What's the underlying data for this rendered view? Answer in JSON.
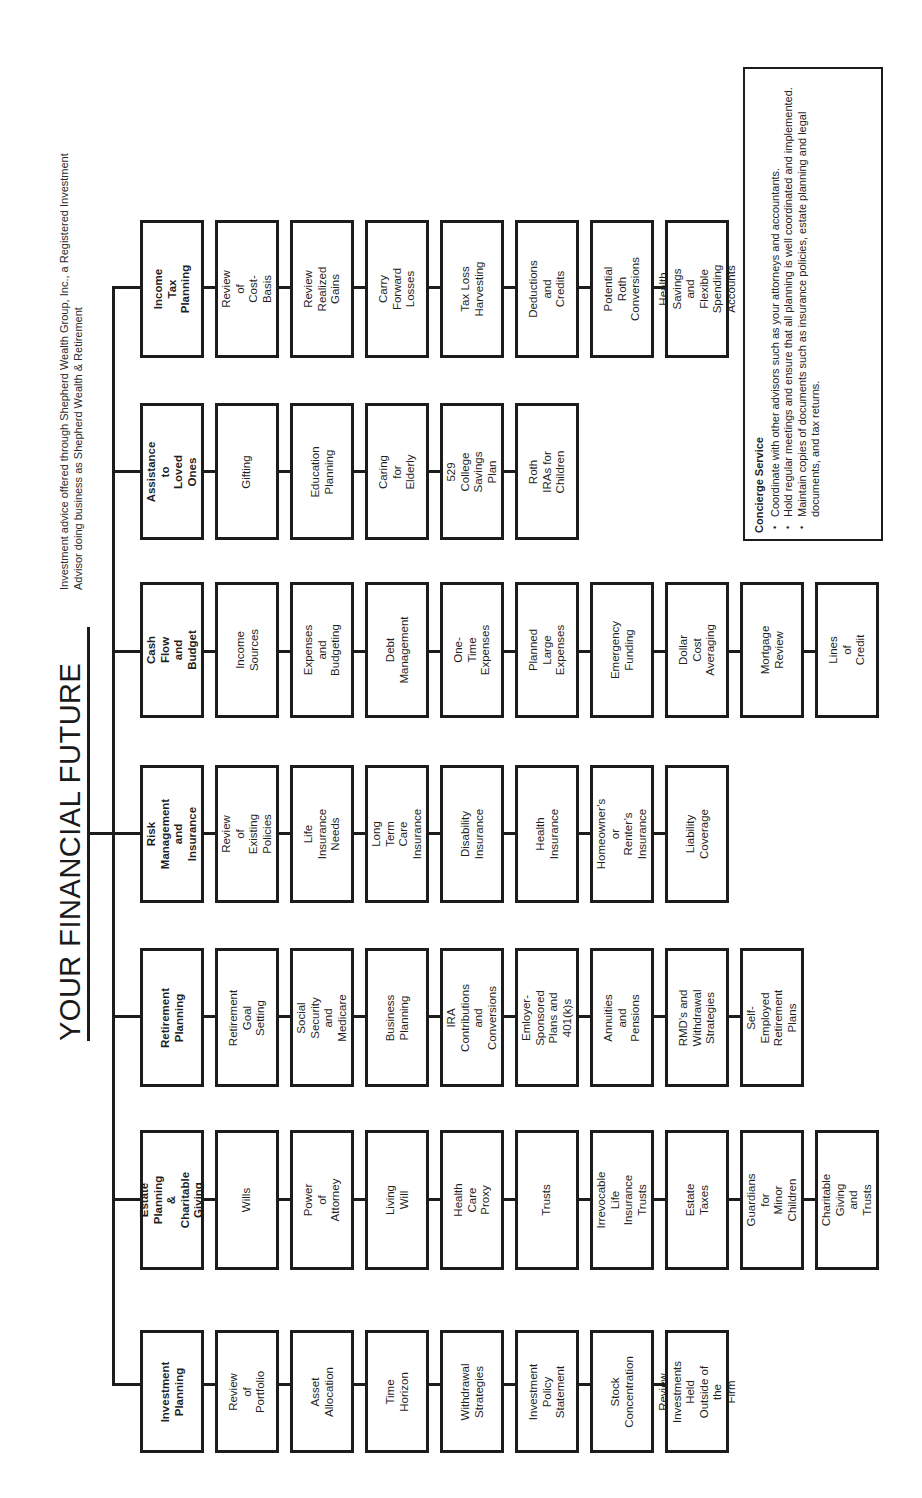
{
  "title": "YOUR FINANCIAL FUTURE",
  "disclaimer": "Investment advice offered through Shepherd Wealth Group, Inc., a Registered Investment\nAdvisor doing business as Shepherd Wealth & Retirement",
  "concierge": {
    "title": "Concierge Service",
    "items": [
      "Coordinate with other advisors such as your attorneys and accountants.",
      "Hold regular meetings and ensure that all planning is well coordinated and implemented.",
      "Maintain copies of documents such as insurance policies, estate planning and legal documents, and tax returns."
    ]
  },
  "groups": [
    {
      "head": "Income Tax\nPlanning",
      "items": [
        "Review of\nCost-Basis",
        "Review Realized\nGains",
        "Carry Forward\nLosses",
        "Tax Loss\nHarvesting",
        "Deductions and\nCredits",
        "Potential Roth\nConversions",
        "Health Savings and\nFlexible Spending\nAccounts"
      ]
    },
    {
      "head": "Assistance to\nLoved Ones",
      "items": [
        "Gifting",
        "Education\nPlanning",
        "Caring for\nElderly",
        "529 College\nSavings Plan",
        "Roth IRAs for\nChildren"
      ]
    },
    {
      "head": "Cash Flow\nand Budget",
      "items": [
        "Income\nSources",
        "Expenses and\nBudgeting",
        "Debt\nManagement",
        "One-Time\nExpenses",
        "Planned Large\nExpenses",
        "Emergency\nFunding",
        "Dollar Cost\nAveraging",
        "Mortgage\nReview",
        "Lines of\nCredit"
      ]
    },
    {
      "head": "Risk Management\nand Insurance",
      "items": [
        "Review of\nExisting Policies",
        "Life Insurance\nNeeds",
        "Long Term Care\nInsurance",
        "Disability\nInsurance",
        "Health\nInsurance",
        "Homeowner’s or\nRenter’s Insurance",
        "Liability\nCoverage"
      ]
    },
    {
      "head": "Retirement\nPlanning",
      "items": [
        "Retirement\nGoal Setting",
        "Social Security\nand Medicare",
        "Business\nPlanning",
        "IRA Contributions\nand Conversions",
        "Emloyer-Sponsored\nPlans and 401(k)s",
        "Annuities and\nPensions",
        "RMD’s and\nWithdrawal Strategies",
        "Self-Employed\nRetirement Plans"
      ]
    },
    {
      "head": "Estate Planning\n& Charitable Giving",
      "items": [
        "Wills",
        "Power of\nAttorney",
        "Living Will",
        "Health Care\nProxy",
        "Trusts",
        "Irrevocable Life\nInsurance Trusts",
        "Estate Taxes",
        "Guardians for\nMinor Children",
        "Charitable Giving\nand Trusts"
      ]
    },
    {
      "head": "Investment\nPlanning",
      "items": [
        "Review of\nPortfolio",
        "Asset\nAllocation",
        "Time\nHorizon",
        "Withdrawal\nStrategies",
        "Investment Policy\nStatement",
        "Stock\nConcentration",
        "Review Investments\nHeld Outside of the\nFirm"
      ]
    }
  ]
}
